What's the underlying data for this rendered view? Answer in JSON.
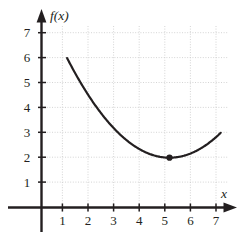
{
  "figure": {
    "name": "graph-of-f",
    "background_color": "#ffffff",
    "axis_color": "#231f20",
    "grid_color": "#c9c9c9",
    "curve_color": "#231f20",
    "point_color": "#231f20"
  },
  "chart_data": {
    "type": "line",
    "title": "",
    "subtitle": "",
    "xlabel": "x",
    "ylabel": "f(x)",
    "xlim": [
      0,
      7.6
    ],
    "ylim": [
      0,
      7.6
    ],
    "xticks": [
      1,
      2,
      3,
      4,
      5,
      6,
      7
    ],
    "yticks": [
      1,
      2,
      3,
      4,
      5,
      6,
      7
    ],
    "xtick_labels": [
      "1",
      "2",
      "3",
      "4",
      "5",
      "6",
      "7"
    ],
    "ytick_labels": [
      "1",
      "2",
      "3",
      "4",
      "5",
      "6",
      "7"
    ],
    "grid": true,
    "grid_style": "dotted",
    "legend": null,
    "legend_position": "none",
    "series": [
      {
        "name": "f(x)",
        "type": "line",
        "equation": "f(x) = 0.25(x - 5)^2 + 2",
        "x": [
          1,
          1.5,
          2,
          2.5,
          3,
          3.5,
          4,
          4.5,
          5,
          5.5,
          6,
          6.5,
          7
        ],
        "y": [
          6,
          5.0625,
          4.25,
          3.5625,
          3,
          2.5625,
          2.25,
          2.0625,
          2,
          2.0625,
          2.25,
          2.5625,
          6
        ]
      }
    ],
    "markers": [
      {
        "name": "vertex-point",
        "x": 5,
        "y": 2,
        "label": "",
        "style": "filled-circle"
      }
    ],
    "annotations": []
  },
  "axis_labels": {
    "x_axis": "x",
    "y_axis": "f(x)"
  },
  "y_tick_labels": [
    "7",
    "6",
    "5",
    "4",
    "3",
    "2",
    "1"
  ],
  "x_tick_labels": [
    "1",
    "2",
    "3",
    "4",
    "5",
    "6",
    "7"
  ]
}
